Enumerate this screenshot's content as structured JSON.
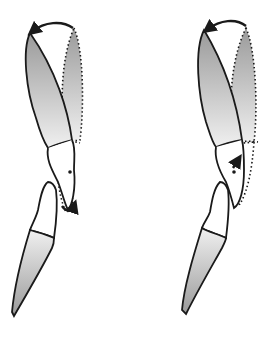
{
  "diagram": {
    "title": "",
    "panels": [
      {
        "id": "left",
        "description": "Upper tooth rotated lingually with crown-tip arrow; lower tooth below; rotation arrow near apex",
        "rotation_center": "dot in root area",
        "arrow_position": "below root apex"
      },
      {
        "id": "right",
        "description": "Upper tooth rotated lingually with crown-tip arrow; lower tooth below; arrow within root near center of rotation",
        "rotation_center": "dot in root area",
        "arrow_position": "inside root near center"
      }
    ],
    "colors": {
      "outline": "#1a1a1a",
      "crown_dark": "#9a9a9a",
      "crown_light": "#f0f0f0",
      "background": "#ffffff"
    }
  }
}
